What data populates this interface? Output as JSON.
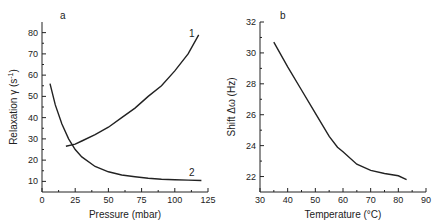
{
  "chart_data": [
    {
      "type": "line",
      "panel_label": "a",
      "title": "",
      "xlabel": "Pressure (mbar)",
      "ylabel": "Relaxation γ (s⁻¹)",
      "xlim": [
        0,
        125
      ],
      "ylim": [
        5,
        85
      ],
      "xticks": [
        0,
        25,
        50,
        75,
        100,
        125
      ],
      "yticks": [
        10,
        20,
        30,
        40,
        50,
        60,
        70,
        80
      ],
      "grid": false,
      "series": [
        {
          "name": "1",
          "x": [
            18,
            25,
            30,
            40,
            50,
            60,
            70,
            80,
            90,
            100,
            110,
            118
          ],
          "y": [
            26.5,
            27.5,
            29,
            32,
            35.5,
            40,
            44.5,
            50,
            55,
            62,
            70,
            79
          ]
        },
        {
          "name": "2",
          "x": [
            6,
            10,
            15,
            20,
            25,
            30,
            40,
            50,
            60,
            70,
            80,
            90,
            100,
            110,
            120
          ],
          "y": [
            56,
            46,
            37,
            30,
            25,
            21.5,
            17,
            14.5,
            13,
            12.2,
            11.5,
            11,
            10.8,
            10.6,
            10.4
          ]
        }
      ]
    },
    {
      "type": "line",
      "panel_label": "b",
      "title": "",
      "xlabel": "Temperature (°C)",
      "ylabel": "Shift Δω (Hz)",
      "xlim": [
        30,
        90
      ],
      "ylim": [
        21,
        32
      ],
      "xticks": [
        30,
        40,
        50,
        60,
        70,
        80,
        90
      ],
      "yticks": [
        22,
        24,
        26,
        28,
        30,
        32
      ],
      "grid": false,
      "series": [
        {
          "name": "shift",
          "x": [
            35,
            40,
            45,
            50,
            55,
            58,
            60,
            65,
            70,
            75,
            80,
            83
          ],
          "y": [
            30.7,
            29.1,
            27.6,
            26.1,
            24.6,
            23.9,
            23.6,
            22.8,
            22.4,
            22.2,
            22.05,
            21.8
          ]
        }
      ]
    }
  ],
  "labels": {
    "a": {
      "panel": "a",
      "xlabel": "Pressure (mbar)",
      "ylabel_main": "Relaxation",
      "ylabel_sym": "γ (s",
      "ylabel_sup": "-1",
      "ylabel_end": ")",
      "curve1": "1",
      "curve2": "2"
    },
    "b": {
      "panel": "b",
      "xlabel": "Temperature (°C)",
      "ylabel": "Shift  Δω (Hz)"
    }
  }
}
